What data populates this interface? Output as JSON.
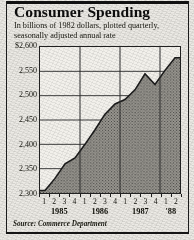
{
  "title": "Consumer Spending",
  "subtitle_line1": "In billions of 1982 dollars, plotted quarterly,",
  "subtitle_line2": "seasonally adjusted annual rate",
  "source": "Source: Commerce Department",
  "colors": {
    "ink": "#121212",
    "paper": "#eceae5",
    "fill": "#8d8c86",
    "stroke": "#1b1b1b",
    "grid": "#3a3a3a"
  },
  "chart_data": {
    "type": "area",
    "title": "Consumer Spending",
    "subtitle": "In billions of 1982 dollars, plotted quarterly, seasonally adjusted annual rate",
    "xlabel": "",
    "ylabel": "",
    "ylim": [
      2300,
      2600
    ],
    "ytick_labels": [
      "$2,600",
      "2,550",
      "2,500",
      "2,450",
      "2,400",
      "2,350",
      "2,300"
    ],
    "yticks": [
      2600,
      2550,
      2500,
      2450,
      2400,
      2350,
      2300
    ],
    "grid": true,
    "legend": "none",
    "years": [
      "1985",
      "1986",
      "1987",
      "'88"
    ],
    "quarter_labels": [
      "1",
      "2",
      "3",
      "4",
      "1",
      "2",
      "3",
      "4",
      "1",
      "2",
      "3",
      "4",
      "1",
      "2"
    ],
    "x": [
      "1985 Q1",
      "1985 Q2",
      "1985 Q3",
      "1985 Q4",
      "1986 Q1",
      "1986 Q2",
      "1986 Q3",
      "1986 Q4",
      "1987 Q1",
      "1987 Q2",
      "1987 Q3",
      "1987 Q4",
      "1988 Q1",
      "1988 Q2"
    ],
    "values": [
      2305,
      2330,
      2360,
      2372,
      2400,
      2430,
      2462,
      2483,
      2492,
      2512,
      2545,
      2523,
      2552,
      2578
    ]
  }
}
